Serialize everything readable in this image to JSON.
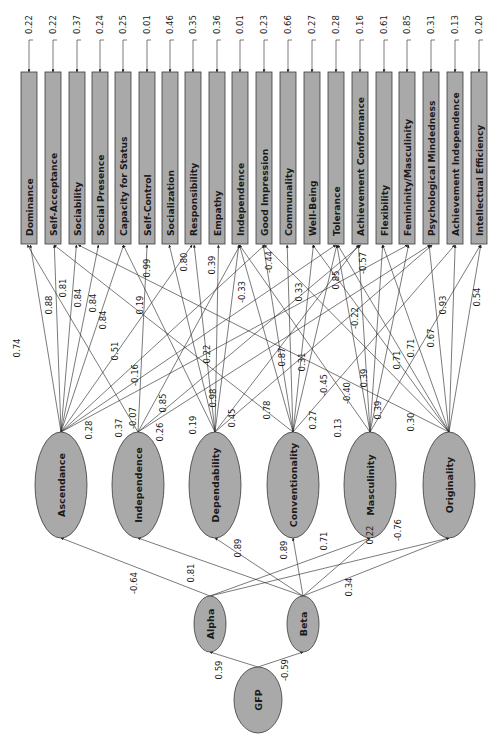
{
  "diagram": {
    "type": "structural-equation-model",
    "orientation": "rotated-90",
    "observed": [
      {
        "label": "Dominance",
        "x": 29,
        "error": "0.22"
      },
      {
        "label": "Self-Acceptance",
        "x": 53,
        "error": "0.22"
      },
      {
        "label": "Sociability",
        "x": 77,
        "error": "0.37"
      },
      {
        "label": "Social Presence",
        "x": 100,
        "error": "0.24"
      },
      {
        "label": "Capacity for Status",
        "x": 123,
        "error": "0.25"
      },
      {
        "label": "Self-Control",
        "x": 147,
        "error": "0.01"
      },
      {
        "label": "Socialization",
        "x": 170,
        "error": "0.46"
      },
      {
        "label": "Responsibility",
        "x": 193,
        "error": "0.35"
      },
      {
        "label": "Empathy",
        "x": 217,
        "error": "0.36"
      },
      {
        "label": "Independence",
        "x": 240,
        "error": "0.01"
      },
      {
        "label": "Good Impression",
        "x": 264,
        "error": "0.23"
      },
      {
        "label": "Communality",
        "x": 288,
        "error": "0.66"
      },
      {
        "label": "Well-Being",
        "x": 312,
        "error": "0.27"
      },
      {
        "label": "Tolerance",
        "x": 336,
        "error": "0.28"
      },
      {
        "label": "Achievement Conformance",
        "x": 360,
        "error": "0.16"
      },
      {
        "label": "Flexibility",
        "x": 384,
        "error": "0.61"
      },
      {
        "label": "Femininity/Masculinity",
        "x": 407,
        "error": "0.85"
      },
      {
        "label": "Psychological Mindedness",
        "x": 431,
        "error": "0.31"
      },
      {
        "label": "Achievement Independence",
        "x": 455,
        "error": "0.13"
      },
      {
        "label": "Intellectual Efficiency",
        "x": 479,
        "error": "0.20"
      }
    ],
    "factors": [
      {
        "label": "Ascendance",
        "cx": 61,
        "cy": 485
      },
      {
        "label": "Independence",
        "cx": 138,
        "cy": 485
      },
      {
        "label": "Dependability",
        "cx": 215,
        "cy": 485
      },
      {
        "label": "Conventionality",
        "cx": 293,
        "cy": 485
      },
      {
        "label": "Masculinity",
        "cx": 370,
        "cy": 485
      },
      {
        "label": "Originality",
        "cx": 449,
        "cy": 485
      }
    ],
    "higher_order": [
      {
        "label": "Alpha",
        "cx": 210,
        "cy": 624,
        "rx": 16,
        "ry": 28
      },
      {
        "label": "Beta",
        "cx": 303,
        "cy": 624,
        "rx": 16,
        "ry": 28
      },
      {
        "label": "GFP",
        "cx": 258,
        "cy": 700,
        "rx": 24,
        "ry": 33
      }
    ],
    "loadings": [
      {
        "from": 0,
        "to": 0,
        "value": "0.74",
        "lx": 20,
        "ly": 348
      },
      {
        "from": 0,
        "to": 1,
        "value": "0.88",
        "lx": 52,
        "ly": 305
      },
      {
        "from": 0,
        "to": 2,
        "value": "0.81",
        "lx": 66,
        "ly": 288
      },
      {
        "from": 0,
        "to": 3,
        "value": "0.84",
        "lx": 81,
        "ly": 298
      },
      {
        "from": 0,
        "to": 4,
        "value": "0.84",
        "lx": 96,
        "ly": 303
      },
      {
        "from": 0,
        "to": 7,
        "value": "0.84",
        "lx": 106,
        "ly": 320
      },
      {
        "from": 0,
        "to": 10,
        "value": "0.51",
        "lx": 118,
        "ly": 351
      },
      {
        "from": 0,
        "to": 13,
        "value": "-0.16",
        "lx": 138,
        "ly": 375
      },
      {
        "from": 0,
        "to": 16,
        "value": "0.28",
        "lx": 92,
        "ly": 430
      },
      {
        "from": 1,
        "to": 0,
        "value": "0.37",
        "lx": 122,
        "ly": 428
      },
      {
        "from": 1,
        "to": 5,
        "value": "0.19",
        "lx": 143,
        "ly": 305
      },
      {
        "from": 1,
        "to": 9,
        "value": "-0.07",
        "lx": 136,
        "ly": 418
      },
      {
        "from": 1,
        "to": 14,
        "value": "0.85",
        "lx": 166,
        "ly": 403
      },
      {
        "from": 1,
        "to": 17,
        "value": "0.26",
        "lx": 163,
        "ly": 432
      },
      {
        "from": 2,
        "to": 4,
        "value": "0.99",
        "lx": 150,
        "ly": 268
      },
      {
        "from": 2,
        "to": 6,
        "value": "0.19",
        "lx": 196,
        "ly": 425
      },
      {
        "from": 2,
        "to": 7,
        "value": "0.80",
        "lx": 187,
        "ly": 262
      },
      {
        "from": 2,
        "to": 8,
        "value": "0.39",
        "lx": 215,
        "ly": 265
      },
      {
        "from": 2,
        "to": 9,
        "value": "0.98",
        "lx": 216,
        "ly": 398
      },
      {
        "from": 2,
        "to": 14,
        "value": "0.22",
        "lx": 210,
        "ly": 354
      },
      {
        "from": 2,
        "to": 17,
        "value": "0.45",
        "lx": 235,
        "ly": 418
      },
      {
        "from": 3,
        "to": 1,
        "value": "0.78",
        "lx": 270,
        "ly": 410
      },
      {
        "from": 3,
        "to": 9,
        "value": "-0.33",
        "lx": 245,
        "ly": 292
      },
      {
        "from": 3,
        "to": 10,
        "value": "-0.44",
        "lx": 272,
        "ly": 262
      },
      {
        "from": 3,
        "to": 11,
        "value": "0.87",
        "lx": 285,
        "ly": 357
      },
      {
        "from": 3,
        "to": 12,
        "value": "0.33",
        "lx": 302,
        "ly": 292
      },
      {
        "from": 3,
        "to": 13,
        "value": "0.31",
        "lx": 305,
        "ly": 362
      },
      {
        "from": 3,
        "to": 18,
        "value": "0.27",
        "lx": 316,
        "ly": 420
      },
      {
        "from": 4,
        "to": 9,
        "value": "0.13",
        "lx": 341,
        "ly": 428
      },
      {
        "from": 4,
        "to": 13,
        "value": "0.85",
        "lx": 339,
        "ly": 280
      },
      {
        "from": 4,
        "to": 14,
        "value": "-0.57",
        "lx": 366,
        "ly": 263
      },
      {
        "from": 4,
        "to": 15,
        "value": "-0.45",
        "lx": 327,
        "ly": 385
      },
      {
        "from": 4,
        "to": 16,
        "value": "-0.40",
        "lx": 350,
        "ly": 393
      },
      {
        "from": 4,
        "to": 19,
        "value": "0.39",
        "lx": 381,
        "ly": 410
      },
      {
        "from": 5,
        "to": 2,
        "value": "-0.22",
        "lx": 358,
        "ly": 318
      },
      {
        "from": 5,
        "to": 10,
        "value": "0.39",
        "lx": 367,
        "ly": 378
      },
      {
        "from": 5,
        "to": 12,
        "value": "0.71",
        "lx": 400,
        "ly": 360
      },
      {
        "from": 5,
        "to": 13,
        "value": "0.71",
        "lx": 414,
        "ly": 348
      },
      {
        "from": 5,
        "to": 15,
        "value": "0.30",
        "lx": 414,
        "ly": 422
      },
      {
        "from": 5,
        "to": 17,
        "value": "0.67",
        "lx": 434,
        "ly": 338
      },
      {
        "from": 5,
        "to": 18,
        "value": "0.93",
        "lx": 446,
        "ly": 305
      },
      {
        "from": 5,
        "to": 19,
        "value": "0.54",
        "lx": 480,
        "ly": 297
      }
    ],
    "structural": [
      {
        "from": "Alpha",
        "to": 0,
        "value": "-0.64",
        "lx": 137,
        "ly": 583
      },
      {
        "from": "Beta",
        "to": 1,
        "value": "0.81",
        "lx": 194,
        "ly": 573
      },
      {
        "from": "Beta",
        "to": 2,
        "value": "0.89",
        "lx": 241,
        "ly": 548
      },
      {
        "from": "Beta",
        "to": 3,
        "value": "0.89",
        "lx": 287,
        "ly": 550
      },
      {
        "from": "Alpha",
        "to": 4,
        "value": "0.71",
        "lx": 327,
        "ly": 541
      },
      {
        "from": "Beta",
        "to": 4,
        "value": "0.22",
        "lx": 373,
        "ly": 535
      },
      {
        "from": "Alpha",
        "to": 5,
        "value": "-0.76",
        "lx": 401,
        "ly": 530
      },
      {
        "from": "Beta",
        "to": 5,
        "value": "0.34",
        "lx": 352,
        "ly": 587
      }
    ],
    "gfp_paths": [
      {
        "to": "Alpha",
        "value": "0.59",
        "lx": 222,
        "ly": 670
      },
      {
        "to": "Beta",
        "value": "-0.59",
        "lx": 288,
        "ly": 670
      }
    ]
  }
}
